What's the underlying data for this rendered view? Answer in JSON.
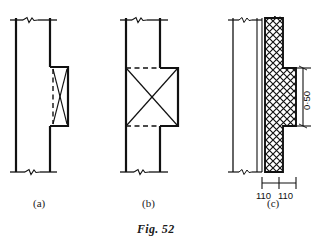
{
  "figure": {
    "caption": "Fig. 52",
    "panels": [
      {
        "id": "a",
        "label": "(a)",
        "description": "wall with shallow pier, hidden dashed face, diagonal cross indication"
      },
      {
        "id": "b",
        "label": "(b)",
        "description": "wall with deep pier, dashed hidden edges top and bottom, full diagonal cross"
      },
      {
        "id": "c",
        "label": "(c)",
        "description": "hatched masonry wall with projecting pier and dimensions"
      }
    ]
  },
  "dimensions": {
    "horizontal": [
      {
        "value": "110"
      },
      {
        "value": "110"
      }
    ],
    "vertical": {
      "value": "0·50"
    }
  },
  "style": {
    "ink": "#111111",
    "paper": "#ffffff",
    "hatch": "#111111"
  }
}
